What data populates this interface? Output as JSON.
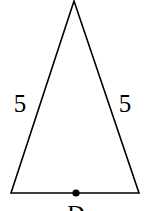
{
  "figure": {
    "type": "isosceles-triangle",
    "stroke_color": "#000000",
    "background": "#ffffff",
    "vertices": {
      "apex": [
        74,
        1
      ],
      "base_left": [
        11,
        193
      ],
      "base_right": [
        139,
        193
      ]
    },
    "sides": {
      "left": {
        "label": "5",
        "label_pos": [
          20,
          112
        ]
      },
      "right": {
        "label": "5",
        "label_pos": [
          125,
          112
        ]
      }
    },
    "base_point": {
      "label": "D",
      "position": [
        76,
        193
      ],
      "label_pos": [
        76,
        221
      ]
    }
  }
}
